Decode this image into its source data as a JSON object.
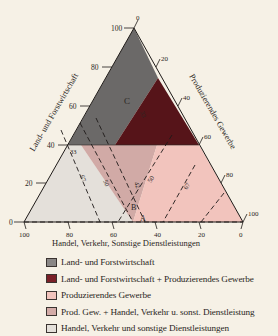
{
  "diagram": {
    "type": "ternary",
    "axes": {
      "left": {
        "label": "Land- und Forstwirtschaft",
        "ticks": [
          "0",
          "20",
          "40",
          "60",
          "80",
          "100"
        ]
      },
      "right": {
        "label": "Produzierendes Gewerbe",
        "ticks": [
          "0",
          "20",
          "40",
          "60",
          "80",
          "100"
        ]
      },
      "bottom": {
        "label": "Handel, Verkehr, Sonstige Dienstleistungen",
        "ticks": [
          "100",
          "80",
          "60",
          "40",
          "20",
          "0"
        ]
      }
    },
    "region_labels": {
      "C": "C",
      "B": "B",
      "A": "A"
    },
    "line_labels": {
      "l33_left": "33",
      "l33_top": "33",
      "l50_a": "50",
      "l50_b": "50",
      "l67_left": "67",
      "l67_right": "67",
      "l42": "42"
    },
    "colors": {
      "land_forst": "#6b6968",
      "land_forst_prod": "#561419",
      "prod": "#f2c4bd",
      "prod_handel": "#d1aaa6",
      "handel": "#e4e0da"
    }
  },
  "legend": {
    "items": [
      {
        "label": "Land- und Forstwirtschaft",
        "color": "#8a8786"
      },
      {
        "label": "Land- und Forstwirtschaft + Produzierendes Gewerbe",
        "color": "#7a2028"
      },
      {
        "label": "Produzierendes Gewerbe",
        "color": "#f2c4bd"
      },
      {
        "label": "Prod. Gew. + Handel, Verkehr u. sonst. Dienstleistung",
        "color": "#d4aca8"
      },
      {
        "label": "Handel, Verkehr und sonstige Dienstleistungen",
        "color": "#e4e0da"
      }
    ]
  }
}
